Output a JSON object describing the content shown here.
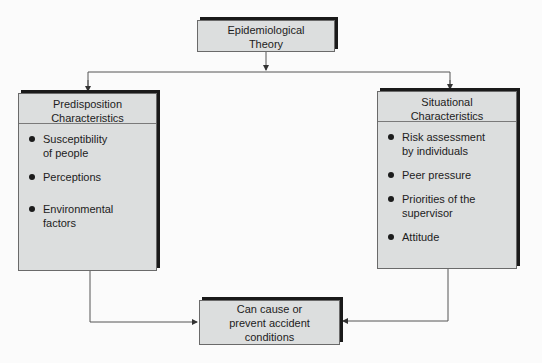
{
  "diagram": {
    "top": {
      "label_line1": "Epidemiological",
      "label_line2": "Theory"
    },
    "left": {
      "header_line1": "Predisposition",
      "header_line2": "Characteristics",
      "items": [
        {
          "line1": "Susceptibility",
          "line2": "of people"
        },
        {
          "line1": "Perceptions",
          "line2": ""
        },
        {
          "line1": "Environmental",
          "line2": "factors"
        }
      ]
    },
    "right": {
      "header_line1": "Situational",
      "header_line2": "Characteristics",
      "items": [
        {
          "line1": "Risk assessment",
          "line2": "by individuals"
        },
        {
          "line1": "Peer pressure",
          "line2": ""
        },
        {
          "line1": "Priorities of the",
          "line2": "supervisor"
        },
        {
          "line1": "Attitude",
          "line2": ""
        }
      ]
    },
    "bottom": {
      "label_line1": "Can cause or",
      "label_line2": "prevent accident",
      "label_line3": "conditions"
    },
    "colors": {
      "box_fill": "#dcdede",
      "shadow": "#1a1a1a",
      "line": "#555555"
    }
  }
}
